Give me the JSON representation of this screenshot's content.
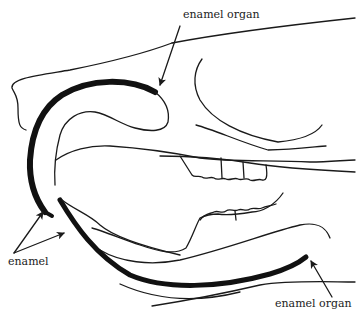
{
  "diagram": {
    "type": "anatomical-line-drawing",
    "colors": {
      "line": "#1a1a1a",
      "enamel": "#111111",
      "background": "#ffffff"
    },
    "labels": [
      {
        "id": "enamel-organ-top",
        "text": "enamel organ"
      },
      {
        "id": "enamel-left",
        "text": "enamel"
      },
      {
        "id": "enamel-organ-bottom",
        "text": "enamel organ"
      }
    ]
  }
}
